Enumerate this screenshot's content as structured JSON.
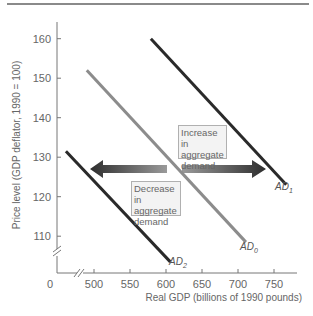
{
  "chart_data": {
    "type": "line",
    "title": "",
    "xlabel": "Real GDP (billions of 1990 pounds)",
    "ylabel": "Price level (GDP deflator, 1990 = 100)",
    "x_ticks": [
      500,
      550,
      600,
      650,
      700,
      750
    ],
    "y_ticks": [
      110,
      120,
      130,
      140,
      150,
      160
    ],
    "origin_label": "0",
    "xlim": [
      460,
      780
    ],
    "ylim": [
      100,
      165
    ],
    "axis_breaks": {
      "x": true,
      "y": true
    },
    "grid": false,
    "series": [
      {
        "name": "AD1",
        "label_main": "AD",
        "label_sub": "1",
        "color": "#2a2a2a",
        "points": [
          {
            "x": 579,
            "y": 160
          },
          {
            "x": 767,
            "y": 123
          }
        ]
      },
      {
        "name": "AD0",
        "label_main": "AD",
        "label_sub": "0",
        "color": "#8c8c8c",
        "points": [
          {
            "x": 490,
            "y": 152
          },
          {
            "x": 711,
            "y": 108.5
          }
        ]
      },
      {
        "name": "AD2",
        "label_main": "AD",
        "label_sub": "2",
        "color": "#2a2a2a",
        "points": [
          {
            "x": 461,
            "y": 131.5
          },
          {
            "x": 606,
            "y": 103.5
          }
        ]
      }
    ],
    "annotations": [
      {
        "id": "increase",
        "text_lines": [
          "Increase in",
          "aggregate",
          "demand"
        ],
        "arrow_direction": "right"
      },
      {
        "id": "decrease",
        "text_lines": [
          "Decrease in",
          "aggregate",
          "demand"
        ],
        "arrow_direction": "left"
      }
    ]
  },
  "labels": {
    "increase_1": "Increase in",
    "increase_2": "aggregate",
    "increase_3": "demand",
    "decrease_1": "Decrease in",
    "decrease_2": "aggregate",
    "decrease_3": "demand"
  }
}
